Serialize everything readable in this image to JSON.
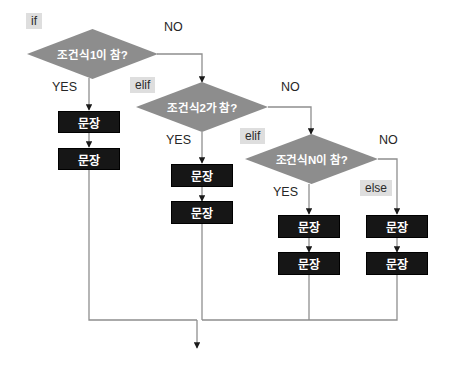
{
  "diagram": {
    "type": "flowchart",
    "colors": {
      "decision_fill": "#8d8d8d",
      "decision_text": "#ffffff",
      "process_fill": "#161616",
      "process_text": "#ffffff",
      "keyword_tag_fill": "#dedede",
      "keyword_tag_text": "#2b2b2b",
      "edge_line": "#8f8f8f",
      "edge_label_text": "#262626",
      "background": "#ffffff"
    },
    "keywords": [
      {
        "id": "kw-if",
        "label": "if"
      },
      {
        "id": "kw-elif1",
        "label": "elif"
      },
      {
        "id": "kw-elif2",
        "label": "elif"
      },
      {
        "id": "kw-else",
        "label": "else"
      }
    ],
    "decisions": [
      {
        "id": "decision-1",
        "label": "조건식1이 참?"
      },
      {
        "id": "decision-2",
        "label": "조건식2가 참?"
      },
      {
        "id": "decision-3",
        "label": "조건식N이 참?"
      }
    ],
    "edge_labels": {
      "yes_1": "YES",
      "no_1": "NO",
      "yes_2": "YES",
      "no_2": "NO",
      "yes_3": "YES",
      "no_3": "NO"
    },
    "branches": [
      {
        "id": "branch-if",
        "statements": [
          {
            "id": "stmt-if-1",
            "label": "문장"
          },
          {
            "id": "stmt-if-2",
            "label": "문장"
          }
        ]
      },
      {
        "id": "branch-elif-1",
        "statements": [
          {
            "id": "stmt-elif1-1",
            "label": "문장"
          },
          {
            "id": "stmt-elif1-2",
            "label": "문장"
          }
        ]
      },
      {
        "id": "branch-elif-n",
        "statements": [
          {
            "id": "stmt-elifn-1",
            "label": "문장"
          },
          {
            "id": "stmt-elifn-2",
            "label": "문장"
          }
        ]
      },
      {
        "id": "branch-else",
        "statements": [
          {
            "id": "stmt-else-1",
            "label": "문장"
          },
          {
            "id": "stmt-else-2",
            "label": "문장"
          }
        ]
      }
    ]
  }
}
